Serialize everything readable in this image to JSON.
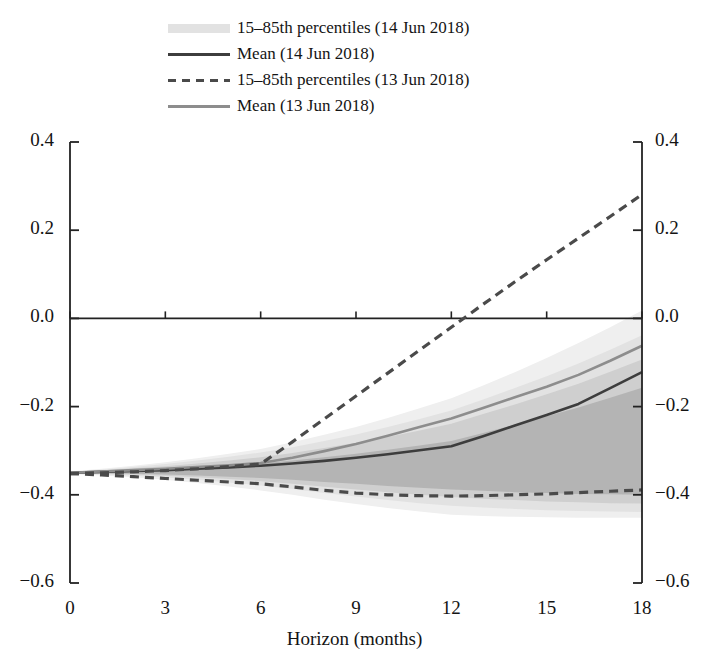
{
  "legend": {
    "items": [
      {
        "key": "band-swatch",
        "label": "15–85th percentiles (14 Jun 2018)"
      },
      {
        "key": "solid-dark",
        "label": "Mean (14 Jun 2018)"
      },
      {
        "key": "dashed-dark",
        "label": "15–85th percentiles (13 Jun 2018)"
      },
      {
        "key": "solid-gray",
        "label": "Mean (13 Jun 2018)"
      }
    ]
  },
  "axes": {
    "x_title": "Horizon (months)",
    "x_ticks": [
      "0",
      "3",
      "6",
      "9",
      "12",
      "15",
      "18"
    ],
    "y_ticks": [
      "0.4",
      "0.2",
      "0.0",
      "−0.2",
      "−0.4",
      "−0.6"
    ]
  },
  "colors": {
    "band_1": "#efefef",
    "band_2": "#e2e2e2",
    "band_3": "#cfcfcf",
    "band_4": "#b4b4b4",
    "mean_current": "#3d3d3d",
    "mean_previous": "#8d8d8d",
    "dashed_previous": "#4a4a4a",
    "axis": "#222222",
    "zero_line": "#222222"
  },
  "chart_data": {
    "type": "area",
    "title": "",
    "xlabel": "Horizon (months)",
    "ylabel": "",
    "xlim": [
      0,
      18
    ],
    "ylim": [
      -0.6,
      0.4
    ],
    "grid": false,
    "legend_position": "top-left",
    "x": [
      0,
      1,
      2,
      3,
      4,
      5,
      6,
      7,
      8,
      9,
      10,
      11,
      12,
      13,
      14,
      15,
      16,
      17,
      18
    ],
    "series": [
      {
        "name": "Mean (14 Jun 2018)",
        "style": "solid",
        "color": "#3d3d3d",
        "values": [
          -0.35,
          -0.348,
          -0.346,
          -0.344,
          -0.341,
          -0.338,
          -0.334,
          -0.329,
          -0.323,
          -0.316,
          -0.308,
          -0.299,
          -0.29,
          -0.267,
          -0.243,
          -0.219,
          -0.194,
          -0.158,
          -0.122
        ]
      },
      {
        "name": "Mean (13 Jun 2018)",
        "style": "solid",
        "color": "#8d8d8d",
        "values": [
          -0.35,
          -0.347,
          -0.344,
          -0.341,
          -0.337,
          -0.333,
          -0.328,
          -0.316,
          -0.301,
          -0.285,
          -0.266,
          -0.246,
          -0.227,
          -0.203,
          -0.179,
          -0.155,
          -0.128,
          -0.096,
          -0.062
        ]
      },
      {
        "name": "85th percentile (13 Jun 2018)",
        "style": "dashed",
        "color": "#4a4a4a",
        "values": [
          -0.352,
          -0.35,
          -0.348,
          -0.345,
          -0.341,
          -0.336,
          -0.33,
          -0.28,
          -0.228,
          -0.176,
          -0.124,
          -0.072,
          -0.02,
          0.032,
          0.083,
          0.133,
          0.182,
          0.231,
          0.281
        ]
      },
      {
        "name": "15th percentile (13 Jun 2018)",
        "style": "dashed",
        "color": "#4a4a4a",
        "values": [
          -0.352,
          -0.355,
          -0.359,
          -0.363,
          -0.367,
          -0.371,
          -0.375,
          -0.382,
          -0.39,
          -0.396,
          -0.4,
          -0.402,
          -0.403,
          -0.402,
          -0.4,
          -0.398,
          -0.395,
          -0.392,
          -0.389
        ]
      }
    ],
    "bands": [
      {
        "name": "15-85th percentiles (14 Jun 2018) outer",
        "color": "#efefef",
        "lower": [
          -0.353,
          -0.356,
          -0.36,
          -0.366,
          -0.373,
          -0.381,
          -0.39,
          -0.4,
          -0.411,
          -0.421,
          -0.43,
          -0.438,
          -0.445,
          -0.448,
          -0.45,
          -0.451,
          -0.452,
          -0.452,
          -0.452
        ],
        "upper": [
          -0.347,
          -0.341,
          -0.334,
          -0.326,
          -0.317,
          -0.307,
          -0.296,
          -0.281,
          -0.264,
          -0.246,
          -0.226,
          -0.204,
          -0.181,
          -0.152,
          -0.122,
          -0.09,
          -0.056,
          -0.02,
          0.018
        ]
      },
      {
        "name": "15-85th percentiles (14 Jun 2018) mid-outer",
        "color": "#e2e2e2",
        "lower": [
          -0.352,
          -0.354,
          -0.357,
          -0.361,
          -0.366,
          -0.372,
          -0.379,
          -0.387,
          -0.396,
          -0.404,
          -0.412,
          -0.419,
          -0.425,
          -0.429,
          -0.432,
          -0.435,
          -0.437,
          -0.438,
          -0.439
        ],
        "upper": [
          -0.348,
          -0.343,
          -0.337,
          -0.33,
          -0.322,
          -0.314,
          -0.304,
          -0.292,
          -0.278,
          -0.263,
          -0.246,
          -0.228,
          -0.209,
          -0.184,
          -0.158,
          -0.131,
          -0.102,
          -0.071,
          -0.038
        ]
      },
      {
        "name": "15-85th percentiles (14 Jun 2018) mid-inner",
        "color": "#cfcfcf",
        "lower": [
          -0.351,
          -0.352,
          -0.354,
          -0.357,
          -0.36,
          -0.364,
          -0.369,
          -0.375,
          -0.382,
          -0.388,
          -0.394,
          -0.4,
          -0.405,
          -0.409,
          -0.412,
          -0.415,
          -0.417,
          -0.419,
          -0.42
        ],
        "upper": [
          -0.349,
          -0.345,
          -0.34,
          -0.335,
          -0.329,
          -0.322,
          -0.315,
          -0.305,
          -0.294,
          -0.282,
          -0.269,
          -0.254,
          -0.239,
          -0.217,
          -0.195,
          -0.172,
          -0.148,
          -0.121,
          -0.093
        ]
      },
      {
        "name": "15-85th percentiles (14 Jun 2018) inner",
        "color": "#b4b4b4",
        "lower": [
          -0.351,
          -0.351,
          -0.352,
          -0.354,
          -0.356,
          -0.359,
          -0.362,
          -0.366,
          -0.371,
          -0.375,
          -0.38,
          -0.384,
          -0.388,
          -0.391,
          -0.394,
          -0.396,
          -0.398,
          -0.399,
          -0.4
        ],
        "upper": [
          -0.349,
          -0.347,
          -0.344,
          -0.341,
          -0.337,
          -0.333,
          -0.329,
          -0.322,
          -0.315,
          -0.307,
          -0.298,
          -0.288,
          -0.278,
          -0.26,
          -0.241,
          -0.222,
          -0.202,
          -0.18,
          -0.157
        ]
      }
    ]
  }
}
